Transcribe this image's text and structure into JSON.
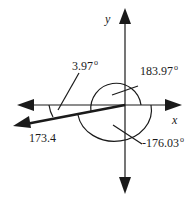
{
  "diagram": {
    "type": "vector-angle-diagram",
    "axes": {
      "x_label": "x",
      "y_label": "y"
    },
    "vector": {
      "magnitude_label": "173.4",
      "direction": "lower-left, slightly below negative x-axis"
    },
    "angles": [
      {
        "id": "below-neg-x",
        "value": "3.97",
        "unit": "o",
        "description": "angle between negative x-axis and vector"
      },
      {
        "id": "ccw-from-pos-x",
        "value": "183.97",
        "unit": "o",
        "description": "counterclockwise angle from positive x-axis"
      },
      {
        "id": "cw-from-pos-x",
        "value": "-176.03",
        "unit": "o",
        "description": "clockwise angle from positive x-axis"
      }
    ],
    "colors": {
      "line": "#1a1a1a",
      "background": "#ffffff"
    }
  }
}
